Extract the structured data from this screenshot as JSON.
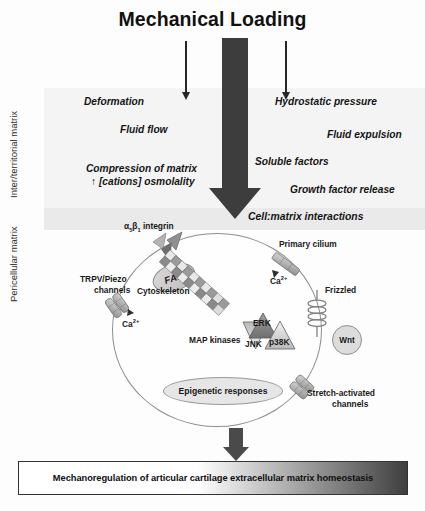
{
  "figure": {
    "title": "Mechanical Loading",
    "outcome_banner": "Mechanoregulation of articular cartilage extracellular matrix homeostasis"
  },
  "zones": [
    {
      "id": "inter-territorial",
      "label": "Inter/territorial\nmatrix"
    },
    {
      "id": "pericellular",
      "label": "Pericellular\nmatrix"
    }
  ],
  "zone_labels": {
    "inter_territorial": "Inter/territorial matrix",
    "pericellular": "Pericellular matrix"
  },
  "stimuli": {
    "left": [
      {
        "text": "Deformation"
      },
      {
        "text": "Fluid flow"
      },
      {
        "text": "Compression of matrix"
      },
      {
        "text": "↑ [cations] osmolality"
      }
    ],
    "right": [
      {
        "text": "Hydrostatic pressure"
      },
      {
        "text": "Fluid expulsion"
      },
      {
        "text": "Soluble factors"
      },
      {
        "text": "Growth factor release"
      }
    ],
    "center": {
      "text": "Cell:matrix interactions"
    }
  },
  "cell": {
    "components": [
      {
        "id": "integrin",
        "label": "α5β1 integrin"
      },
      {
        "id": "fak",
        "label": "FAK"
      },
      {
        "id": "cytoskeleton",
        "label": "Cytoskeleton"
      },
      {
        "id": "trpv",
        "label": "TRPV/Piezo\nchannels"
      },
      {
        "id": "trpv-l1",
        "label": "TRPV/Piezo"
      },
      {
        "id": "trpv-l2",
        "label": "channels"
      },
      {
        "id": "calcium-left",
        "label": "Ca2+"
      },
      {
        "id": "cilium",
        "label": "Primary cilium"
      },
      {
        "id": "calcium-cilium",
        "label": "Ca2+"
      },
      {
        "id": "frizzled",
        "label": "Frizzled"
      },
      {
        "id": "wnt",
        "label": "Wnt"
      },
      {
        "id": "stretch-l1",
        "label": "Stretch-activated"
      },
      {
        "id": "stretch-l2",
        "label": "channels"
      },
      {
        "id": "mapk",
        "label": "MAP kinases"
      },
      {
        "id": "erk",
        "label": "ERK"
      },
      {
        "id": "jnk",
        "label": "JNK"
      },
      {
        "id": "p38k",
        "label": "p38K"
      },
      {
        "id": "epigenetic",
        "label": "Epigenetic responses"
      }
    ]
  },
  "colors": {
    "arrow_dark": "#3d3d3d",
    "band": "#f4f4f4",
    "cell_outline": "#8e8e8e",
    "banner_dark": "#3f3f3f",
    "text": "#1a1a1a"
  }
}
